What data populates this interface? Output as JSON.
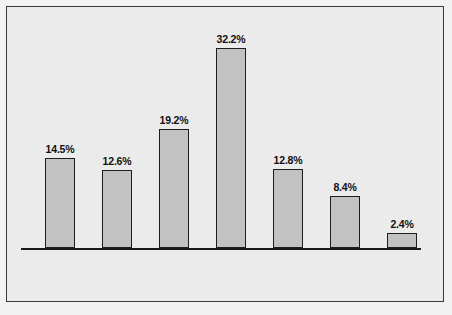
{
  "chart_data": {
    "type": "bar",
    "title": "",
    "subtitle": "",
    "xlabel": "",
    "ylabel": "",
    "ylim": [
      0,
      35
    ],
    "grid": false,
    "legend": "none",
    "categories": [
      "North America",
      "Western Europe",
      "Japan",
      "Asia (not including Japan)",
      "Latin America",
      "Africa",
      "Middle East"
    ],
    "values": [
      14.5,
      12.6,
      19.2,
      32.2,
      12.8,
      8.4,
      2.4
    ],
    "value_labels": [
      "14.5%",
      "12.6%",
      "19.2%",
      "32.2%",
      "12.8%",
      "8.4%",
      "2.4%"
    ],
    "bars": [
      {
        "category": "North America",
        "value": 14.5,
        "value_label": "14.5%",
        "label_lines": [
          "North",
          "America"
        ]
      },
      {
        "category": "Western Europe",
        "value": 12.6,
        "value_label": "12.6%",
        "label_lines": [
          "Western",
          "Europe"
        ]
      },
      {
        "category": "Japan",
        "value": 19.2,
        "value_label": "19.2%",
        "label_lines": [
          "Japan"
        ]
      },
      {
        "category": "Asia (not including Japan)",
        "value": 32.2,
        "value_label": "32.2%",
        "label_lines": [
          "Asia",
          "(not including",
          "Japan)"
        ]
      },
      {
        "category": "Latin America",
        "value": 12.8,
        "value_label": "12.8%",
        "label_lines": [
          "Latin",
          "America"
        ]
      },
      {
        "category": "Africa",
        "value": 8.4,
        "value_label": "8.4%",
        "label_lines": [
          "Africa"
        ]
      },
      {
        "category": "Middle East",
        "value": 2.4,
        "value_label": "2.4%",
        "label_lines": [
          "Middle",
          "East"
        ]
      }
    ]
  },
  "style": {
    "background_color": "#ebebeb",
    "bar_fill_color": "#c2c2c2",
    "bar_border_color": "#1d1d1d",
    "axis_color": "#1a1a1a",
    "frame_border_color": "#3a3a3a",
    "text_color": "#111111"
  }
}
